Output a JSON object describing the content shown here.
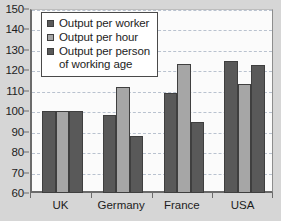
{
  "chart_data": {
    "type": "bar",
    "title": "",
    "subtitle": "",
    "xlabel": "",
    "ylabel": "",
    "categories": [
      "UK",
      "Germany",
      "France",
      "USA"
    ],
    "series": [
      {
        "name": "Output per worker",
        "color": "#595959",
        "values": [
          100,
          98,
          109,
          124.5
        ]
      },
      {
        "name": "Output per hour",
        "color": "#a6a6a6",
        "values": [
          100,
          112,
          123,
          113.5
        ]
      },
      {
        "name": "Output per person\nof working age",
        "color": "#595959",
        "values": [
          100,
          88,
          94.5,
          122.5
        ]
      }
    ],
    "ylim": [
      60,
      150
    ],
    "ytick_step": 10,
    "yticks": [
      150,
      140,
      130,
      120,
      110,
      100,
      90,
      80,
      70,
      60
    ],
    "grid": true,
    "legend_position": "top-left",
    "annotations": []
  },
  "colors": {
    "series_dark": "#595959",
    "series_light": "#a6a6a6",
    "bar_outline": "#3f3f3f",
    "axis": "#6b6b6b",
    "gridline": "#b9c2cf",
    "plot_background": "#fbfbfb",
    "figure_background": "#d6d6d6",
    "legend_background": "#ffffff",
    "legend_border": "#4a4a4a",
    "text": "#1d1d1d"
  }
}
